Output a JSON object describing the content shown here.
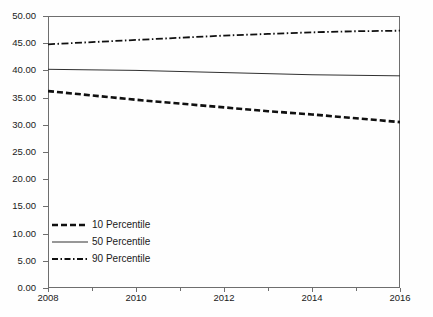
{
  "chart_data": {
    "type": "line",
    "title": "",
    "subtitle": "",
    "xlabel": "",
    "ylabel": "",
    "xlim": [
      2008,
      2016
    ],
    "ylim": [
      0,
      50
    ],
    "ytick_step": 5,
    "grid": false,
    "legend_position": "lower-left-inside",
    "x": [
      2008,
      2009,
      2010,
      2011,
      2012,
      2013,
      2014,
      2015,
      2016
    ],
    "xtick_labels": [
      "2008",
      "2010",
      "2012",
      "2014",
      "2016"
    ],
    "xtick_values": [
      2008,
      2010,
      2012,
      2014,
      2016
    ],
    "xtick_minor_values": [
      2009,
      2011,
      2013,
      2015
    ],
    "ytick_labels": [
      "50.00",
      "45.00",
      "40.00",
      "35.00",
      "30.00",
      "25.00",
      "20.00",
      "15.00",
      "10.00",
      "5.00",
      "0.00"
    ],
    "ytick_values": [
      50,
      45,
      40,
      35,
      30,
      25,
      20,
      15,
      10,
      5,
      0
    ],
    "series": [
      {
        "name": "10 Percentile",
        "style": "dashed",
        "color": "#101010",
        "width": 2.6,
        "values": [
          36.2,
          35.4,
          34.6,
          33.9,
          33.2,
          32.5,
          31.9,
          31.2,
          30.5
        ]
      },
      {
        "name": "50 Percentile",
        "style": "solid",
        "color": "#303030",
        "width": 1.0,
        "values": [
          40.2,
          40.1,
          40.0,
          39.8,
          39.6,
          39.4,
          39.2,
          39.1,
          39.0
        ]
      },
      {
        "name": "90 Percentile",
        "style": "dash-dot",
        "color": "#101010",
        "width": 1.8,
        "values": [
          44.8,
          45.2,
          45.6,
          46.0,
          46.4,
          46.7,
          47.0,
          47.2,
          47.3
        ]
      }
    ]
  },
  "legend": {
    "items": [
      {
        "label": "10 Percentile"
      },
      {
        "label": "50 Percentile"
      },
      {
        "label": "90 Percentile"
      }
    ]
  },
  "axes": {
    "frame_color": "#6e6e6e"
  }
}
